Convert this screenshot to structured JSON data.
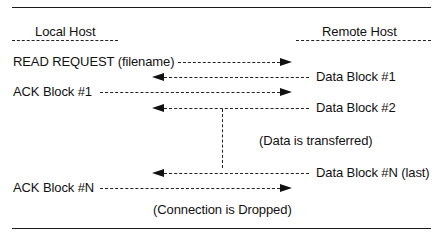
{
  "diagram": {
    "headers": {
      "local": "Local Host",
      "remote": "Remote Host"
    },
    "messages": [
      {
        "label": "READ REQUEST (filename)",
        "direction": "local-to-remote"
      },
      {
        "label": "Data Block #1",
        "direction": "remote-to-local"
      },
      {
        "label": "ACK Block #1",
        "direction": "local-to-remote"
      },
      {
        "label": "Data Block #2",
        "direction": "remote-to-local"
      },
      {
        "label": "Data Block #N (last)",
        "direction": "remote-to-local"
      },
      {
        "label": "ACK Block #N",
        "direction": "local-to-remote"
      }
    ],
    "notes": {
      "transfer": "(Data is transferred)",
      "dropped": "(Connection is Dropped)"
    }
  }
}
